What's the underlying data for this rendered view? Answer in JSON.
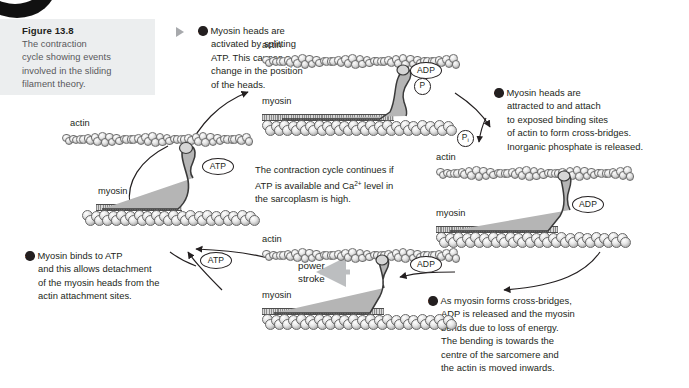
{
  "figure": {
    "title": "Figure 13.8",
    "caption_lines": [
      "The contraction",
      "cycle showing events",
      "involved in the sliding",
      "filament theory."
    ]
  },
  "steps": [
    {
      "number": "1",
      "lines": [
        "Myosin heads are",
        "activated by splitting",
        "ATP. This causes a",
        "change in the position",
        "of the heads."
      ]
    },
    {
      "number": "2",
      "lines": [
        "Myosin heads are",
        "attracted to and attach",
        "to exposed binding sites",
        "of actin to form cross-bridges.",
        "Inorganic phosphate is released."
      ]
    },
    {
      "number": "3",
      "lines": [
        "As myosin forms cross-bridges,",
        "ADP is released and the myosin",
        "bends due to loss of energy.",
        "The bending is towards the",
        "centre of the sarcomere and",
        "the actin is moved inwards."
      ]
    },
    {
      "number": "4",
      "lines": [
        "Myosin binds to ATP",
        "and this allows detachment",
        "of the myosin heads from the",
        "actin attachment sites."
      ]
    }
  ],
  "center_note": {
    "line1": "The contraction cycle continues if",
    "line2a": "ATP is available and Ca",
    "line2sup": "2+",
    "line2b": " level in",
    "line3": "the sarcoplasm is high."
  },
  "diagrams": {
    "top": {
      "actin_label": "actin",
      "myosin_label": "myosin",
      "badges": [
        "ADP",
        "P"
      ]
    },
    "right": {
      "actin_label": "actin",
      "myosin_label": "myosin",
      "badges": [
        "ADP"
      ]
    },
    "bottom": {
      "actin_label": "actin",
      "myosin_label": "myosin",
      "power_stroke_line1": "power",
      "power_stroke_line2": "stroke",
      "badges": [
        "ADP"
      ]
    },
    "left": {
      "actin_label": "actin",
      "myosin_label": "myosin",
      "badges": [
        "ATP"
      ]
    }
  },
  "floating_badges": {
    "phosphate": "P",
    "phosphate_sub": "i",
    "atp_cycle": "ATP"
  },
  "colors": {
    "caption_bg": "#eceeef",
    "caption_title": "#231f20",
    "caption_body": "#58585b",
    "text": "#231f20",
    "arrow": "#231f20",
    "power_arrow": "#bcbec0",
    "marker": "#a7a9ac"
  }
}
